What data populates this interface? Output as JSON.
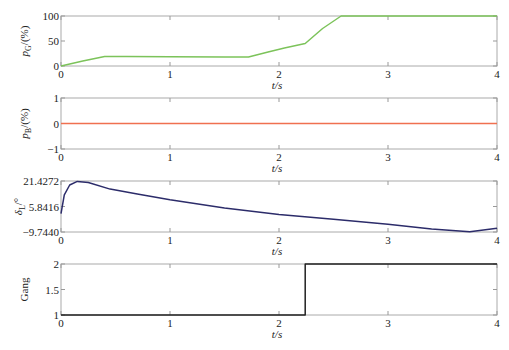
{
  "chart_data": [
    {
      "type": "line",
      "ylabel": "p_G/(%)",
      "xlabel": "t/s",
      "xlim": [
        0,
        4
      ],
      "ylim": [
        0,
        100
      ],
      "xticks": [
        "0",
        "1",
        "2",
        "3",
        "4"
      ],
      "yticks": [
        "0",
        "50",
        "100"
      ],
      "color": "#7cc35a",
      "x": [
        0,
        0.2,
        0.4,
        0.6,
        1.0,
        1.5,
        1.72,
        1.9,
        2.05,
        2.24,
        2.4,
        2.57,
        3.0,
        4.0
      ],
      "y": [
        0,
        10,
        19,
        19,
        18.5,
        18,
        18,
        28,
        36,
        45,
        75,
        100,
        100,
        100
      ]
    },
    {
      "type": "line",
      "ylabel": "p_B/(%)",
      "xlabel": "t/s",
      "xlim": [
        0,
        4
      ],
      "ylim": [
        -1,
        1
      ],
      "xticks": [
        "0",
        "1",
        "2",
        "3",
        "4"
      ],
      "yticks": [
        "-1",
        "0",
        "1"
      ],
      "color": "#f07050",
      "x": [
        0,
        4
      ],
      "y": [
        0,
        0
      ]
    },
    {
      "type": "line",
      "ylabel": "δ_L/°",
      "xlabel": "t/s",
      "xlim": [
        0,
        4
      ],
      "ylim": [
        -9.744,
        21.4272
      ],
      "xticks": [
        "0",
        "1",
        "2",
        "3",
        "4"
      ],
      "yticks": [
        "-9.7440",
        "5.8416",
        "21.4272"
      ],
      "color": "#2c2c6a",
      "x": [
        0,
        0.03,
        0.08,
        0.15,
        0.25,
        0.45,
        0.7,
        1.0,
        1.5,
        2.0,
        2.5,
        3.0,
        3.4,
        3.75,
        4.0
      ],
      "y": [
        1.5,
        13,
        19,
        21.2,
        20.5,
        16.5,
        13.5,
        10,
        5,
        1,
        -2,
        -5,
        -8,
        -9.6,
        -7.5
      ]
    },
    {
      "type": "line",
      "ylabel": "Gang",
      "xlabel": "t/s",
      "xlim": [
        0,
        4
      ],
      "ylim": [
        1,
        2
      ],
      "xticks": [
        "0",
        "1",
        "2",
        "3",
        "4"
      ],
      "yticks": [
        "1",
        "1.5",
        "2"
      ],
      "color": "#222222",
      "x": [
        0,
        2.24,
        2.24,
        4
      ],
      "y": [
        1,
        1,
        2,
        2
      ]
    }
  ],
  "panels": [
    {
      "ylabel_main": "p",
      "ylabel_sub": "G",
      "ylabel_tail": "/(%)",
      "xlabel": "t/s"
    },
    {
      "ylabel_main": "p",
      "ylabel_sub": "B",
      "ylabel_tail": "/(%)",
      "xlabel": "t/s"
    },
    {
      "ylabel_main": "δ",
      "ylabel_sub": "L",
      "ylabel_tail": "/°",
      "xlabel": "t/s"
    },
    {
      "ylabel_main": "Gang",
      "ylabel_sub": "",
      "ylabel_tail": "",
      "xlabel": "t/s"
    }
  ]
}
